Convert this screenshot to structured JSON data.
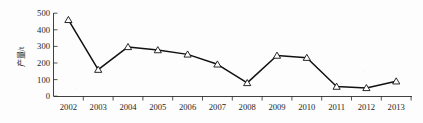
{
  "chart_data": {
    "type": "line",
    "title": "",
    "subtitle": "",
    "xlabel": "",
    "ylabel": "产量/t",
    "categories": [
      "2002",
      "2003",
      "2004",
      "2005",
      "2006",
      "2007",
      "2008",
      "2009",
      "2010",
      "2011",
      "2012",
      "2013"
    ],
    "x": [
      2002,
      2003,
      2004,
      2005,
      2006,
      2007,
      2008,
      2009,
      2010,
      2011,
      2012,
      2013
    ],
    "values": [
      460,
      160,
      297,
      278,
      252,
      192,
      80,
      245,
      232,
      58,
      50,
      90
    ],
    "series": [
      {
        "name": "产量",
        "values": [
          460,
          160,
          297,
          278,
          252,
          192,
          80,
          245,
          232,
          58,
          50,
          90
        ]
      }
    ],
    "ylim": [
      0,
      500
    ],
    "yticks": [
      0,
      100,
      200,
      300,
      400,
      500
    ],
    "ytick_labels": [
      "0",
      "100",
      "200",
      "300",
      "400",
      "500"
    ],
    "xtick_labels": [
      "2002",
      "2003",
      "2004",
      "2005",
      "2006",
      "2007",
      "2008",
      "2009",
      "2010",
      "2011",
      "2012",
      "2013"
    ],
    "grid": false,
    "legend": false,
    "legend_position": "none",
    "marker": "triangle-open",
    "line_color": "#111111",
    "marker_fill": "#ffffff",
    "marker_edge_color": "#111111",
    "annotations": []
  },
  "axes": {
    "y_axis_title": "产量/t",
    "y_tick_0": "0",
    "y_tick_1": "100",
    "y_tick_2": "200",
    "y_tick_3": "300",
    "y_tick_4": "400",
    "y_tick_5": "500",
    "x_tick_0": "2002",
    "x_tick_1": "2003",
    "x_tick_2": "2004",
    "x_tick_3": "2005",
    "x_tick_4": "2006",
    "x_tick_5": "2007",
    "x_tick_6": "2008",
    "x_tick_7": "2009",
    "x_tick_8": "2010",
    "x_tick_9": "2011",
    "x_tick_10": "2012",
    "x_tick_11": "2013"
  }
}
